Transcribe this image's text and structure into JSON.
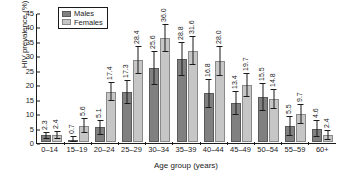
{
  "chart_data": {
    "type": "bar",
    "title": "",
    "xlabel": "Age group (years)",
    "ylabel": "HIV prevalence (%)",
    "ylim": [
      0,
      45
    ],
    "yticks": [
      0,
      5,
      10,
      15,
      20,
      25,
      30,
      35,
      40,
      45
    ],
    "grid": false,
    "legend_position": "top-left",
    "categories": [
      "0–14",
      "15–19",
      "20–24",
      "25–29",
      "30–34",
      "35–39",
      "40–44",
      "45–49",
      "50–54",
      "55–59",
      "60+"
    ],
    "series": [
      {
        "name": "Males",
        "color": "#808080",
        "values": [
          2.3,
          0.7,
          5.1,
          17.3,
          25.6,
          28.8,
          16.8,
          13.4,
          15.5,
          5.5,
          4.6
        ],
        "labels": [
          "2.3",
          "0.7",
          "5.1",
          "17.3",
          "25.6",
          "28.8",
          "16.8",
          "13.4",
          "15.5",
          "5.5",
          "4.6"
        ],
        "ci_low": [
          1.0,
          0.0,
          2.6,
          13.2,
          19.6,
          22.9,
          11.8,
          9.3,
          10.6,
          2.0,
          1.6
        ],
        "ci_high": [
          3.6,
          2.1,
          7.6,
          21.4,
          31.6,
          34.7,
          21.8,
          17.5,
          20.4,
          9.0,
          7.6
        ]
      },
      {
        "name": "Females",
        "color": "#c6c6c6",
        "values": [
          2.4,
          5.6,
          17.4,
          28.4,
          36.0,
          31.6,
          28.0,
          19.7,
          14.8,
          9.7,
          2.4
        ],
        "labels": [
          "2.4",
          "5.6",
          "17.4",
          "28.4",
          "36.0",
          "31.6",
          "28.0",
          "19.7",
          "14.8",
          "9.7",
          "2.4"
        ],
        "ci_low": [
          1.1,
          3.0,
          14.1,
          23.5,
          31.0,
          26.6,
          22.8,
          15.6,
          11.4,
          6.4,
          0.6
        ],
        "ci_high": [
          3.7,
          8.2,
          20.7,
          33.3,
          41.0,
          36.6,
          33.2,
          23.8,
          18.2,
          13.0,
          4.2
        ]
      }
    ]
  },
  "legend": {
    "items": [
      {
        "label": "Males"
      },
      {
        "label": "Females"
      }
    ]
  }
}
